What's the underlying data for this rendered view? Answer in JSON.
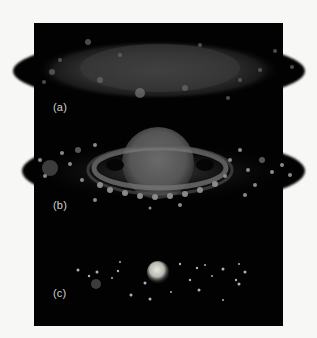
{
  "figure": {
    "background": "#f7f7f5",
    "panel_color": "#020202",
    "stages": [
      {
        "id": "a",
        "label": "(a)",
        "description": "diffuse flattened rotating cloud (disk)"
      },
      {
        "id": "b",
        "label": "(b)",
        "description": "central sphere surrounded by a ring of clumps"
      },
      {
        "id": "c",
        "label": "(c)",
        "description": "central star with scattered small bodies"
      }
    ]
  }
}
